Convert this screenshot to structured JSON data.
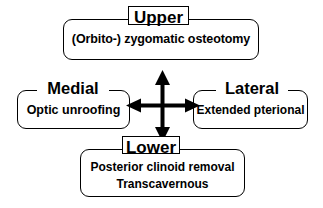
{
  "diagram": {
    "background_color": "#ffffff",
    "line_color": "#000000",
    "center_icon": "four-way-arrow-icon",
    "quadrants": {
      "upper": {
        "heading": "Upper",
        "heading_boxed": true,
        "lines": [
          "(Orbito-) zygomatic osteotomy"
        ]
      },
      "medial": {
        "heading": "Medial",
        "heading_boxed": false,
        "lines": [
          "Optic unroofing"
        ]
      },
      "lateral": {
        "heading": "Lateral",
        "heading_boxed": false,
        "lines": [
          "Extended pterional"
        ]
      },
      "lower": {
        "heading": "Lower",
        "heading_boxed": true,
        "lines": [
          "Posterior clinoid removal",
          "Transcavernous"
        ]
      }
    }
  }
}
